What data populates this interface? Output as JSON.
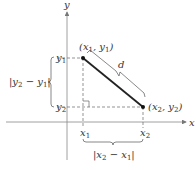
{
  "diagram": {
    "axes": {
      "x_label": "x",
      "y_label": "y"
    },
    "points": [
      {
        "id": "p1",
        "label": "(x1, y1)"
      },
      {
        "id": "p2",
        "label": "(x2, y2)"
      }
    ],
    "segment_label": "d",
    "tick_labels": {
      "x1": "x1",
      "x2": "x2",
      "y1": "y1",
      "y2": "y2"
    },
    "vertical_distance": "|y2 − y1|",
    "horizontal_distance": "|x2 − x1|",
    "colors": {
      "axis": "#777777",
      "segment": "#222222",
      "dashed": "#666666",
      "text": "#333333"
    }
  }
}
